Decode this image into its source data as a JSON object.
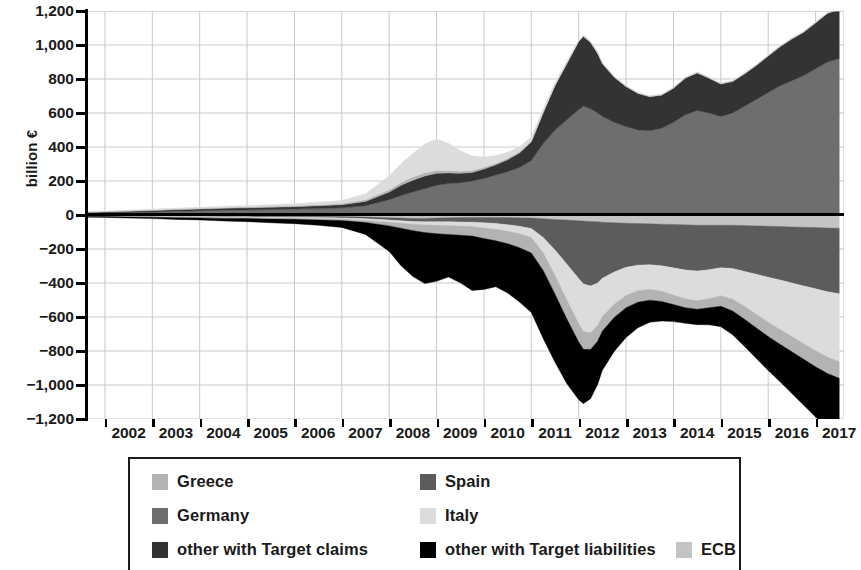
{
  "chart_data": {
    "type": "area",
    "title": "",
    "subtitle": "",
    "xlabel": "",
    "ylabel": "billion €",
    "ylim": [
      -1200,
      1200
    ],
    "ytick_labels": [
      "1,200",
      "1,000",
      "800",
      "600",
      "400",
      "200",
      "0",
      "−200",
      "−400",
      "−600",
      "−800",
      "−1,000",
      "−1,200"
    ],
    "ytick_values": [
      1200,
      1000,
      800,
      600,
      400,
      200,
      0,
      -200,
      -400,
      -600,
      -800,
      -1000,
      -1200
    ],
    "xtick_labels": [
      "2002",
      "2003",
      "2004",
      "2005",
      "2006",
      "2007",
      "2008",
      "2009",
      "2010",
      "2011",
      "2012",
      "2013",
      "2014",
      "2015",
      "2016",
      "2017"
    ],
    "xlim": [
      2001.6,
      2017.6
    ],
    "grid": true,
    "legend_position": "below",
    "stacked": true,
    "x": [
      2001.6,
      2002,
      2002.5,
      2003,
      2003.5,
      2004,
      2004.5,
      2005,
      2005.5,
      2006,
      2006.5,
      2007,
      2007.5,
      2008,
      2008.25,
      2008.5,
      2008.75,
      2009,
      2009.25,
      2009.5,
      2009.75,
      2010,
      2010.25,
      2010.5,
      2010.75,
      2011,
      2011.25,
      2011.5,
      2011.75,
      2012,
      2012.1,
      2012.25,
      2012.4,
      2012.5,
      2012.75,
      2013,
      2013.25,
      2013.5,
      2013.75,
      2014,
      2014.25,
      2014.5,
      2014.75,
      2015,
      2015.25,
      2015.5,
      2015.75,
      2016,
      2016.25,
      2016.5,
      2016.75,
      2017,
      2017.25,
      2017.5
    ],
    "series": [
      {
        "name": "Germany",
        "side": "positive",
        "color": "#6e6e6e",
        "values": [
          10,
          12,
          15,
          18,
          22,
          25,
          28,
          30,
          32,
          35,
          38,
          42,
          55,
          90,
          115,
          135,
          155,
          175,
          185,
          190,
          200,
          215,
          235,
          255,
          280,
          320,
          420,
          500,
          560,
          620,
          640,
          625,
          600,
          580,
          545,
          520,
          500,
          495,
          510,
          545,
          590,
          615,
          600,
          580,
          600,
          640,
          680,
          720,
          760,
          790,
          820,
          860,
          900,
          920
        ]
      },
      {
        "name": "other with Target claims",
        "side": "positive",
        "color": "#333333",
        "values": [
          5,
          6,
          7,
          8,
          9,
          10,
          11,
          12,
          13,
          14,
          16,
          18,
          25,
          45,
          60,
          70,
          75,
          70,
          62,
          55,
          50,
          55,
          60,
          70,
          85,
          110,
          180,
          260,
          330,
          400,
          410,
          390,
          350,
          310,
          265,
          235,
          215,
          200,
          195,
          200,
          215,
          220,
          205,
          190,
          185,
          190,
          200,
          215,
          230,
          245,
          255,
          270,
          285,
          290
        ]
      },
      {
        "name": "Greece",
        "side": "positive",
        "color": "#b3b3b3",
        "values": [
          2,
          2,
          3,
          3,
          4,
          4,
          5,
          5,
          6,
          6,
          7,
          8,
          10,
          14,
          16,
          18,
          18,
          17,
          15,
          13,
          12,
          11,
          10,
          9,
          8,
          7,
          6,
          5,
          4,
          3,
          3,
          3,
          3,
          3,
          3,
          3,
          3,
          3,
          3,
          3,
          3,
          3,
          3,
          3,
          3,
          3,
          3,
          3,
          3,
          3,
          3,
          3,
          3,
          3
        ]
      },
      {
        "name": "Italy",
        "side": "positive",
        "color": "#dcdcdc",
        "values": [
          3,
          3,
          4,
          5,
          6,
          7,
          8,
          9,
          10,
          12,
          14,
          18,
          35,
          80,
          110,
          140,
          170,
          185,
          160,
          120,
          85,
          60,
          45,
          35,
          28,
          22,
          18,
          14,
          10,
          8,
          7,
          6,
          5,
          5,
          4,
          4,
          4,
          4,
          4,
          4,
          4,
          4,
          4,
          4,
          4,
          4,
          4,
          4,
          4,
          4,
          4,
          4,
          4,
          4
        ]
      },
      {
        "name": "ECB",
        "side": "negative",
        "color": "#c4c4c4",
        "values": [
          -3,
          -3,
          -4,
          -4,
          -5,
          -5,
          -6,
          -6,
          -7,
          -7,
          -8,
          -9,
          -12,
          -16,
          -18,
          -20,
          -20,
          -18,
          -16,
          -15,
          -14,
          -14,
          -14,
          -15,
          -16,
          -18,
          -22,
          -26,
          -30,
          -34,
          -36,
          -38,
          -40,
          -42,
          -45,
          -48,
          -50,
          -52,
          -54,
          -56,
          -58,
          -60,
          -60,
          -60,
          -60,
          -62,
          -64,
          -66,
          -68,
          -70,
          -72,
          -74,
          -76,
          -78
        ]
      },
      {
        "name": "Spain",
        "side": "negative",
        "color": "#5c5c5c",
        "values": [
          -2,
          -2,
          -3,
          -3,
          -4,
          -4,
          -5,
          -5,
          -6,
          -6,
          -7,
          -8,
          -10,
          -14,
          -16,
          -18,
          -20,
          -22,
          -24,
          -26,
          -28,
          -32,
          -36,
          -42,
          -50,
          -62,
          -110,
          -180,
          -260,
          -340,
          -370,
          -380,
          -360,
          -330,
          -290,
          -260,
          -245,
          -240,
          -245,
          -255,
          -265,
          -270,
          -262,
          -250,
          -255,
          -270,
          -285,
          -300,
          -315,
          -330,
          -345,
          -360,
          -375,
          -385
        ]
      },
      {
        "name": "Italy",
        "side": "negative",
        "color": "#dcdcdc",
        "values": [
          -2,
          -2,
          -3,
          -3,
          -4,
          -4,
          -5,
          -5,
          -6,
          -6,
          -7,
          -8,
          -10,
          -12,
          -14,
          -16,
          -18,
          -20,
          -22,
          -24,
          -26,
          -30,
          -34,
          -38,
          -44,
          -52,
          -90,
          -150,
          -210,
          -265,
          -280,
          -275,
          -250,
          -225,
          -190,
          -165,
          -150,
          -145,
          -150,
          -160,
          -170,
          -175,
          -170,
          -165,
          -180,
          -205,
          -235,
          -265,
          -290,
          -315,
          -340,
          -365,
          -385,
          -400
        ]
      },
      {
        "name": "Greece",
        "side": "negative",
        "color": "#b3b3b3",
        "values": [
          -2,
          -2,
          -2,
          -3,
          -3,
          -4,
          -4,
          -5,
          -5,
          -6,
          -7,
          -8,
          -12,
          -22,
          -30,
          -38,
          -45,
          -50,
          -52,
          -54,
          -56,
          -62,
          -68,
          -74,
          -82,
          -92,
          -104,
          -110,
          -112,
          -108,
          -104,
          -98,
          -92,
          -86,
          -78,
          -72,
          -68,
          -64,
          -60,
          -56,
          -52,
          -50,
          -54,
          -62,
          -70,
          -76,
          -80,
          -84,
          -88,
          -90,
          -92,
          -94,
          -96,
          -98
        ]
      },
      {
        "name": "other with Target liabilities",
        "side": "negative",
        "color": "#000000",
        "values": [
          -4,
          -5,
          -6,
          -8,
          -10,
          -12,
          -15,
          -18,
          -22,
          -26,
          -32,
          -40,
          -70,
          -150,
          -220,
          -270,
          -300,
          -280,
          -250,
          -280,
          -320,
          -300,
          -270,
          -290,
          -320,
          -350,
          -400,
          -400,
          -380,
          -340,
          -320,
          -290,
          -255,
          -230,
          -200,
          -175,
          -150,
          -130,
          -115,
          -100,
          -92,
          -90,
          -100,
          -120,
          -140,
          -160,
          -180,
          -200,
          -220,
          -245,
          -270,
          -295,
          -315,
          -330
        ]
      }
    ]
  },
  "legend": {
    "rows": [
      [
        {
          "label": "Greece",
          "color": "#b3b3b3",
          "name": "legend-item-greece"
        },
        {
          "label": "Spain",
          "color": "#5c5c5c",
          "name": "legend-item-spain"
        }
      ],
      [
        {
          "label": "Germany",
          "color": "#6e6e6e",
          "name": "legend-item-germany"
        },
        {
          "label": "Italy",
          "color": "#dcdcdc",
          "name": "legend-item-italy"
        }
      ],
      [
        {
          "label": "other with Target claims",
          "color": "#333333",
          "name": "legend-item-other-claims"
        },
        {
          "label": "other with Target liabilities",
          "color": "#000000",
          "name": "legend-item-other-liabilities"
        },
        {
          "label": "ECB",
          "color": "#c4c4c4",
          "name": "legend-item-ecb"
        }
      ]
    ]
  },
  "colors": {
    "greece": "#b3b3b3",
    "spain": "#5c5c5c",
    "germany": "#6e6e6e",
    "italy": "#dcdcdc",
    "other_claims": "#333333",
    "other_liabilities": "#000000",
    "ecb": "#c4c4c4",
    "axis": "#000000",
    "grid": "#c9c9c9"
  }
}
